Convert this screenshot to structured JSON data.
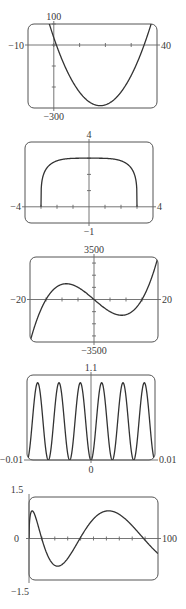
{
  "chart_data": [
    {
      "type": "line",
      "title": "",
      "function": "x^2 - 36x + 35",
      "xlim": [
        -10,
        40
      ],
      "ylim": [
        -300,
        100
      ],
      "labels": {
        "xmin": "−10",
        "xmax": "40",
        "ymin": "−300",
        "ymax": "100"
      },
      "xticks": [
        0,
        10,
        20,
        30
      ],
      "yticks": [
        -200,
        -100,
        0,
        100
      ],
      "grid": false
    },
    {
      "type": "line",
      "title": "",
      "function": "(81 - x^4)^(1/4)",
      "domain": [
        -3,
        3
      ],
      "xlim": [
        -4,
        4
      ],
      "ylim": [
        -1,
        4
      ],
      "labels": {
        "xmin": "−4",
        "xmax": "4",
        "ymin": "−1",
        "ymax": "4"
      },
      "xticks": [
        -3,
        -2,
        -1,
        1,
        2,
        3
      ],
      "yticks": [
        1,
        2,
        3
      ],
      "grid": false
    },
    {
      "type": "line",
      "title": "",
      "function": "x^3 - 225x",
      "xlim": [
        -20,
        20
      ],
      "ylim": [
        -3500,
        3500
      ],
      "labels": {
        "xmin": "−20",
        "xmax": "20",
        "ymin": "−3500",
        "ymax": "3500"
      },
      "xticks": [
        -15,
        -10,
        -5,
        5,
        10,
        15
      ],
      "yticks": [
        -3000,
        -2000,
        -1000,
        1000,
        2000,
        3000
      ],
      "grid": false
    },
    {
      "type": "line",
      "title": "",
      "function": "sin^2(300*pi*x)",
      "xlim": [
        -0.01,
        0.01
      ],
      "ylim": [
        0,
        1.1
      ],
      "labels": {
        "xmin": "−0.01",
        "xmax": "0.01",
        "ymin": "0",
        "ymax": "1.1"
      },
      "xticks": [],
      "yticks": [],
      "grid": false
    },
    {
      "type": "line",
      "title": "",
      "function": "sin(sqrt(x))",
      "xlim": [
        0,
        100
      ],
      "ylim": [
        -1.5,
        1.5
      ],
      "labels": {
        "xmin": "0",
        "xmax": "100",
        "ymin": "−1.5",
        "ymax": "1.5"
      },
      "xticks": [
        10,
        20,
        30,
        40,
        50,
        60,
        70,
        80,
        90
      ],
      "yticks": [],
      "grid": false
    }
  ]
}
